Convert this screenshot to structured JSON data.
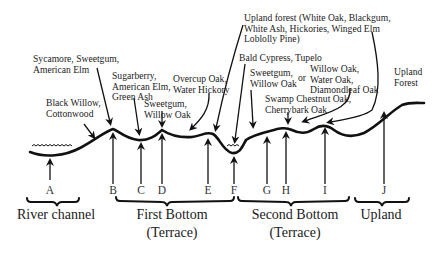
{
  "diagram": {
    "type": "floodplain forest cross-section",
    "species_labels": [
      {
        "id": "sycamore",
        "text": "Sycamore, Sweetgum,\nAmerican Elm"
      },
      {
        "id": "black-willow",
        "text": "Black Willow,\nCottonwood"
      },
      {
        "id": "sugarberry",
        "text": "Sugarberry,\nAmerican Elm,\nGreen Ash"
      },
      {
        "id": "sweetgum-willow-1",
        "text": "Sweetgum,\nWillow Oak"
      },
      {
        "id": "overcup",
        "text": "Overcup Oak,\nWater Hickory"
      },
      {
        "id": "upland-forest-mix",
        "text": "Upland forest (White Oak, Blackgum,\nWhite Ash, Hickories, Winged Elm\nLoblolly Pine)"
      },
      {
        "id": "bald-cypress",
        "text": "Bald Cypress, Tupelo"
      },
      {
        "id": "sweetgum-willow-2",
        "text": "Sweetgum,\nWillow Oak"
      },
      {
        "id": "or",
        "text": "or"
      },
      {
        "id": "willow-water-diamond",
        "text": "Willow Oak,\nWater Oak,\nDiamondleaf Oak"
      },
      {
        "id": "swamp-chestnut",
        "text": "Swamp Chestnut Oak,\nCherrybark Oak"
      },
      {
        "id": "upland-forest",
        "text": "Upland\nForest"
      }
    ],
    "position_letters": [
      "A",
      "B",
      "C",
      "D",
      "E",
      "F",
      "G",
      "H",
      "I",
      "J"
    ],
    "zones": [
      {
        "id": "river-channel",
        "label": "River channel",
        "sublabel": ""
      },
      {
        "id": "first-bottom",
        "label": "First Bottom",
        "sublabel": "(Terrace)"
      },
      {
        "id": "second-bottom",
        "label": "Second Bottom",
        "sublabel": "(Terrace)"
      },
      {
        "id": "upland",
        "label": "Upland",
        "sublabel": ""
      }
    ],
    "colors": {
      "line": "#111111",
      "text": "#222222",
      "background": "#ffffff"
    }
  }
}
